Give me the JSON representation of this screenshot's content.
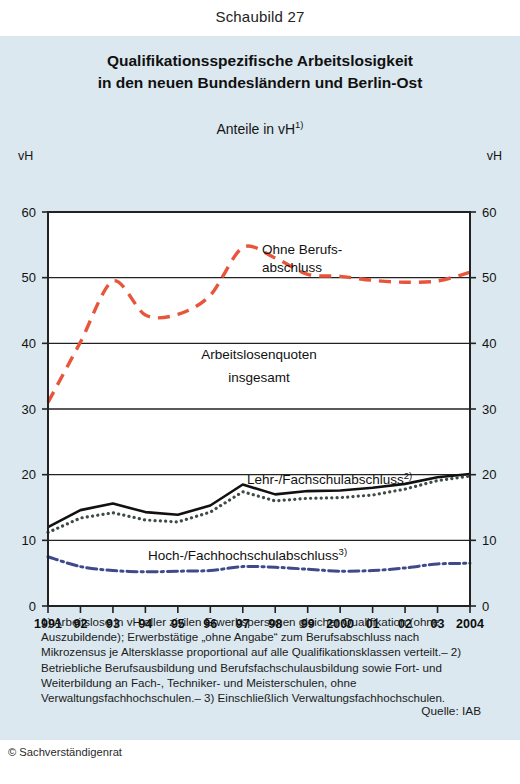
{
  "figure_number": "Schaubild 27",
  "title_line1": "Qualifikationsspezifische Arbeitslosigkeit",
  "title_line2": "in den neuen Bundesländern und Berlin-Ost",
  "subtitle_text": "Anteile in vH",
  "subtitle_sup": "1)",
  "axis_unit_left": "vH",
  "axis_unit_right": "vH",
  "series_labels": {
    "ohne_berufsabschluss_l1": "Ohne Berufs-",
    "ohne_berufsabschluss_l2": "abschluss",
    "insgesamt_l1": "Arbeitslosenquoten",
    "insgesamt_l2": "insgesamt",
    "lehr_fachschul": "Lehr-/Fachschulabschluss",
    "lehr_fachschul_sup": "2)",
    "hoch_fachhoch": "Hoch-/Fachhochschulabschluss",
    "hoch_fachhoch_sup": "3)"
  },
  "footnotes": "1) Arbeitslose in vH aller zivilen Erwerbspersonen gleicher Qualifikation (ohne Auszubildende); Erwerbstätige „ohne Angabe“ zum Berufsabschluss nach Mikrozensus je Altersklasse proportional auf alle Qualifikationsklassen verteilt.– 2) Betriebliche Berufsausbildung und Berufsfachschulausbildung sowie Fort- und Weiterbildung an Fach-, Techniker- und Meisterschulen, ohne Verwaltungsfachhochschulen.– 3) Einschließlich Verwaltungsfachhochschulen.",
  "source": "Quelle: IAB",
  "copyright": "© Sachverständigenrat",
  "colors": {
    "panel_background": "#dbe8ef",
    "page_background": "#ffffff",
    "ohne_berufsabschluss": "#e8553a",
    "insgesamt": "#111111",
    "lehr_fachschul": "#3d4c44",
    "hoch_fachhoch": "#3f4a8a",
    "axis": "#222222"
  },
  "chart_data": {
    "type": "line",
    "title": "Qualifikationsspezifische Arbeitslosigkeit in den neuen Bundesländern und Berlin-Ost",
    "subtitle": "Anteile in vH",
    "xlabel": "",
    "ylabel": "vH",
    "ylim": [
      0,
      60
    ],
    "yticks": [
      0,
      10,
      20,
      30,
      40,
      50,
      60
    ],
    "grid": true,
    "legend_position": "inline-annotations",
    "x": [
      1991,
      1992,
      1993,
      1994,
      1995,
      1996,
      1997,
      1998,
      1999,
      2000,
      2001,
      2002,
      2003,
      2004
    ],
    "xtick_labels": [
      "1991",
      "92",
      "93",
      "94",
      "95",
      "96",
      "97",
      "98",
      "99",
      "2000",
      "01",
      "02",
      "03",
      "2004"
    ],
    "series": [
      {
        "name": "Ohne Berufsabschluss",
        "color": "#e8553a",
        "style": "dashed",
        "values": [
          31.0,
          40.2,
          49.5,
          44.3,
          44.4,
          47.3,
          54.6,
          53.0,
          50.5,
          50.2,
          49.6,
          49.3,
          49.5,
          50.8
        ]
      },
      {
        "name": "Arbeitslosenquoten insgesamt",
        "color": "#111111",
        "style": "solid",
        "values": [
          12.0,
          14.6,
          15.6,
          14.3,
          13.9,
          15.3,
          18.5,
          17.0,
          17.5,
          17.6,
          18.0,
          18.6,
          19.6,
          20.1
        ]
      },
      {
        "name": "Lehr-/Fachschulabschluss",
        "color": "#3d4c44",
        "style": "dotted",
        "values": [
          11.2,
          13.4,
          14.2,
          13.1,
          12.8,
          14.3,
          17.4,
          16.0,
          16.4,
          16.5,
          16.9,
          17.8,
          19.1,
          19.8
        ]
      },
      {
        "name": "Hoch-/Fachhochschulabschluss",
        "color": "#3f4a8a",
        "style": "dashdot",
        "values": [
          7.5,
          6.0,
          5.4,
          5.2,
          5.3,
          5.4,
          6.0,
          5.9,
          5.6,
          5.3,
          5.4,
          5.8,
          6.4,
          6.5
        ]
      }
    ]
  }
}
